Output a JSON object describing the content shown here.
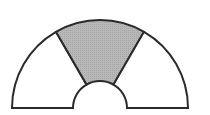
{
  "diagram": {
    "type": "semicircular-annulus",
    "center": [
      100,
      108
    ],
    "outer_radius": 88,
    "inner_radius": 27,
    "sectors": [
      {
        "name": "left",
        "start_deg": 120,
        "end_deg": 180,
        "shaded": false
      },
      {
        "name": "middle",
        "start_deg": 60,
        "end_deg": 120,
        "shaded": true
      },
      {
        "name": "right",
        "start_deg": 0,
        "end_deg": 60,
        "shaded": false
      }
    ],
    "colors": {
      "stroke": "#2a2a2a",
      "shade": "#b3b3b3",
      "background": "#ffffff",
      "unshaded": "#ffffff"
    },
    "stroke_width": 2
  }
}
